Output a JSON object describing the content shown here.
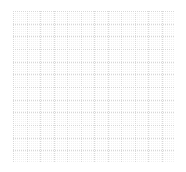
{
  "canvas": {
    "width": 186,
    "height": 172,
    "background_color": "#ffffff"
  },
  "grid": {
    "label": "dotted grid",
    "origin_x": 13,
    "origin_y": 11,
    "end_x": 175,
    "end_y": 163,
    "width": 162,
    "height": 152,
    "columns": 12,
    "rows": 12,
    "cell_width": 13.5,
    "cell_height": 12.67,
    "line_color": "#d9d9d9",
    "minor_dot_color": "#f2f2f2",
    "line_style": "dotted",
    "line_width": 1,
    "dash_pattern": "1,1"
  },
  "chart_data": {
    "type": "table",
    "title": "",
    "subtitle": "",
    "xlabel": "",
    "ylabel": "",
    "grid": true,
    "legend": false,
    "annotations": [],
    "categories": [],
    "values": [],
    "x_ticks": [
      13,
      26.5,
      40,
      53.5,
      67,
      80.5,
      94,
      107.5,
      121,
      134.5,
      148,
      161.5,
      175
    ],
    "y_ticks": [
      11,
      23.7,
      36.3,
      49,
      61.7,
      74.3,
      87,
      99.7,
      112.3,
      125,
      137.7,
      150.3,
      163
    ],
    "xlim": [
      13,
      175
    ],
    "ylim": [
      11,
      163
    ]
  }
}
